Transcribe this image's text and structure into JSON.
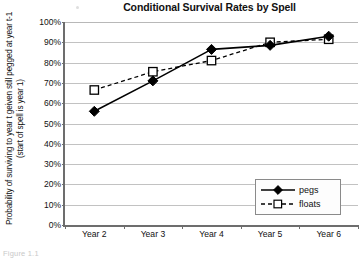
{
  "figure": {
    "caption": "Figure 1.1"
  },
  "chart_data": {
    "type": "line",
    "title": "Conditional Survival Rates by Spell",
    "xlabel": "",
    "ylabel": "Probability of surviving to year t geiven still pegged at year t-1 (start of spell is year 1)",
    "categories": [
      "Year 2",
      "Year 3",
      "Year 4",
      "Year 5",
      "Year 6"
    ],
    "series": [
      {
        "name": "pegs",
        "marker": "filled-diamond",
        "line_style": "solid",
        "values": [
          56,
          71,
          86.5,
          88.5,
          93
        ]
      },
      {
        "name": "floats",
        "marker": "open-square",
        "line_style": "dashed",
        "values": [
          66.5,
          75.5,
          81,
          90,
          91.5
        ]
      }
    ],
    "ylim": [
      0,
      100
    ],
    "y_ticks": [
      "0%",
      "10%",
      "20%",
      "30%",
      "40%",
      "50%",
      "60%",
      "70%",
      "80%",
      "90%",
      "100%"
    ],
    "y_tick_values": [
      0,
      10,
      20,
      30,
      40,
      50,
      60,
      70,
      80,
      90,
      100
    ],
    "grid": true,
    "legend_position": "lower-right",
    "colors": {
      "series_pegs": "#000000",
      "series_floats": "#000000",
      "gridline": "#c2c2c2",
      "axis": "#6d6d6d",
      "background": "#ffffff"
    }
  }
}
